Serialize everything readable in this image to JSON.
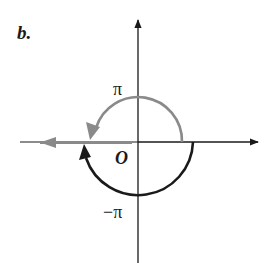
{
  "figure": {
    "panel_label": "b.",
    "labels": {
      "pi": "π",
      "origin": "O",
      "neg_pi": "−π"
    },
    "colors": {
      "axes": "#1a1a1a",
      "positive_arc": "#8a8a8a",
      "negative_arc": "#1a1a1a",
      "branch_cut_ray": "#8a8a8a",
      "background": "#ffffff"
    },
    "elements": [
      {
        "name": "x-axis",
        "description": "horizontal axis with arrow pointing right"
      },
      {
        "name": "y-axis",
        "description": "vertical axis with arrow pointing up"
      },
      {
        "name": "positive-arc",
        "description": "gray counterclockwise semicircle from positive real axis through top, arrow ending at negative real axis, labeled π"
      },
      {
        "name": "negative-arc",
        "description": "black clockwise semicircle from positive real axis through bottom, arrow ending at negative real axis, labeled −π"
      },
      {
        "name": "negative-real-ray",
        "description": "gray ray along negative real axis with leftward arrow"
      }
    ]
  }
}
